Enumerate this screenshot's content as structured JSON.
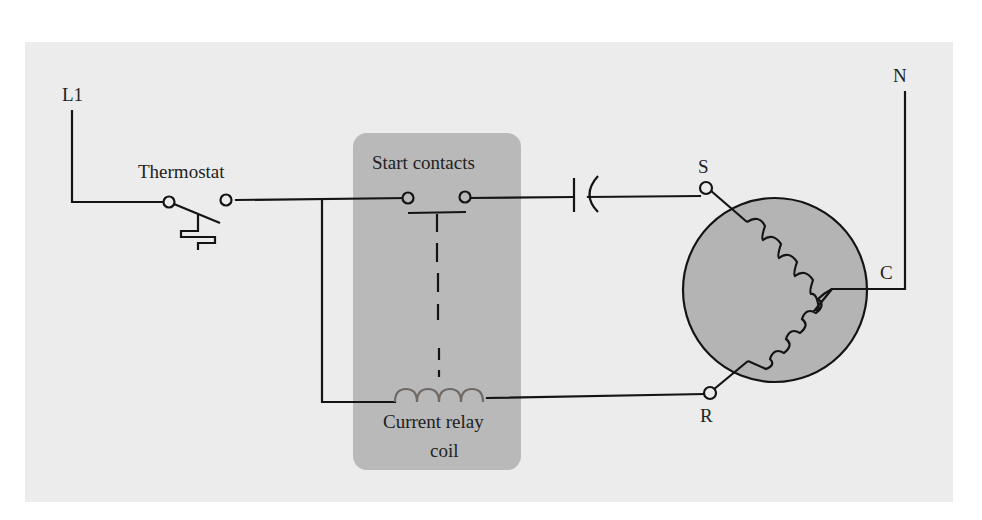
{
  "diagram": {
    "type": "electrical-schematic",
    "colors": {
      "background": "#ffffff",
      "panel": "#ececec",
      "relay_box": "#b9b9b9",
      "motor_fill": "#b4b4b4",
      "wire": "#141414",
      "coil": "#6f6a66"
    },
    "labels": {
      "line": "L1",
      "neutral": "N",
      "thermostat": "Thermostat",
      "start_contacts": "Start contacts",
      "relay_coil_line1": "Current relay",
      "relay_coil_line2": "coil",
      "start_terminal": "S",
      "run_terminal": "R",
      "common_terminal": "C"
    },
    "components": [
      {
        "id": "thermostat",
        "kind": "temperature-switch (normally closed)"
      },
      {
        "id": "start-contacts",
        "kind": "relay contacts (normally open)"
      },
      {
        "id": "start-capacitor",
        "kind": "capacitor"
      },
      {
        "id": "current-relay-coil",
        "kind": "coil"
      },
      {
        "id": "motor",
        "kind": "single-phase motor with start and run windings",
        "terminals": [
          "S",
          "R",
          "C"
        ]
      }
    ],
    "connections": [
      [
        "L1",
        "thermostat"
      ],
      [
        "thermostat",
        "start-contacts"
      ],
      [
        "thermostat",
        "current-relay-coil"
      ],
      [
        "start-contacts",
        "start-capacitor"
      ],
      [
        "start-capacitor",
        "S"
      ],
      [
        "current-relay-coil",
        "R"
      ],
      [
        "C",
        "N"
      ]
    ]
  }
}
